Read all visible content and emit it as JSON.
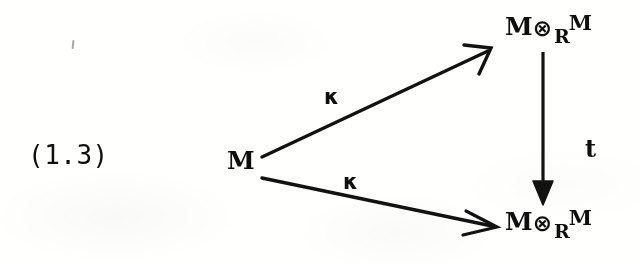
{
  "figure": {
    "equation_tag": "(1.3)",
    "kind": "commutative-diagram"
  },
  "objects": {
    "source": {
      "text": "M"
    },
    "top_right": {
      "left": "M",
      "tensor": "⊗",
      "subscript": "R",
      "right": "M"
    },
    "bottom_right": {
      "left": "M",
      "tensor": "⊗",
      "subscript": "R",
      "right": "M"
    }
  },
  "arrows": {
    "upper": {
      "label": "κ",
      "from": "source",
      "to": "top_right",
      "head": "open-barb"
    },
    "lower": {
      "label": "κ",
      "from": "source",
      "to": "bottom_right",
      "head": "barbed"
    },
    "vertical": {
      "label": "t",
      "from": "top_right",
      "to": "bottom_right",
      "head": "filled-triangle"
    }
  },
  "colors": {
    "ink": "#111111",
    "paper": "#fdfdfc"
  }
}
